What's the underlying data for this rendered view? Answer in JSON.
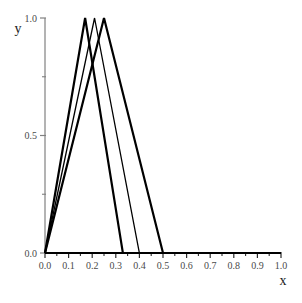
{
  "chart_data": {
    "type": "line",
    "title": "",
    "xlabel": "x",
    "ylabel": "y",
    "xlim": [
      0.0,
      1.0
    ],
    "ylim": [
      0.0,
      1.0
    ],
    "grid": false,
    "legend": null,
    "x_major_ticks": [
      0.0,
      0.1,
      0.2,
      0.3,
      0.4,
      0.5,
      0.6,
      0.7,
      0.8,
      0.9,
      1.0
    ],
    "x_tick_labels": [
      "0.0",
      "0.1",
      "0.2",
      "0.3",
      "0.4",
      "0.5",
      "0.6",
      "0.7",
      "0.8",
      "0.9",
      "1.0"
    ],
    "x_minor_ticks": [
      0.05,
      0.15,
      0.25,
      0.35,
      0.45,
      0.55,
      0.65,
      0.75,
      0.85,
      0.95
    ],
    "y_major_ticks": [
      0.0,
      0.5,
      1.0
    ],
    "y_tick_labels": [
      "0.0",
      "0.5",
      "1.0"
    ],
    "y_minor_ticks": [
      0.25,
      0.75
    ],
    "line_color": "#000000",
    "axis_color": "#808080",
    "baseline_color": "#000000",
    "series": [
      {
        "name": "tent-1",
        "peak_x": 0.17,
        "peak_y": 1.0,
        "right_zero_x": 0.33,
        "line_width": 2.2,
        "x": [
          0.0,
          0.17,
          0.33,
          1.0
        ],
        "values": [
          0.0,
          1.0,
          0.0,
          0.0
        ]
      },
      {
        "name": "tent-2",
        "peak_x": 0.21,
        "peak_y": 1.0,
        "right_zero_x": 0.4,
        "line_width": 1.3,
        "x": [
          0.0,
          0.21,
          0.4,
          1.0
        ],
        "values": [
          0.0,
          1.0,
          0.0,
          0.0
        ]
      },
      {
        "name": "tent-3",
        "peak_x": 0.25,
        "peak_y": 1.0,
        "right_zero_x": 0.5,
        "line_width": 2.2,
        "x": [
          0.0,
          0.25,
          0.5,
          1.0
        ],
        "values": [
          0.0,
          1.0,
          0.0,
          0.0
        ]
      }
    ]
  }
}
